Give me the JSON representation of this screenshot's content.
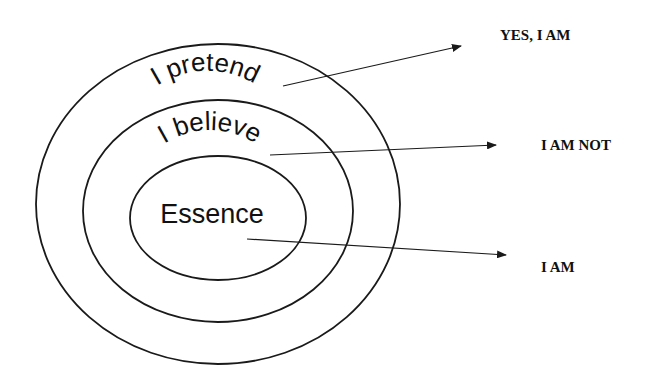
{
  "diagram": {
    "type": "concentric-ellipses-with-arrows",
    "colors": {
      "stroke": "#1a1a1a",
      "text": "#111111",
      "background": "#ffffff"
    },
    "rings": [
      {
        "id": "outer",
        "label": "I pretend",
        "points_to": "YES, I AM"
      },
      {
        "id": "middle",
        "label": "I believe",
        "points_to": "I AM NOT"
      },
      {
        "id": "inner",
        "label": "Essence",
        "points_to": "I AM"
      }
    ],
    "outcomes": [
      "YES, I AM",
      "I AM NOT",
      "I AM"
    ]
  }
}
